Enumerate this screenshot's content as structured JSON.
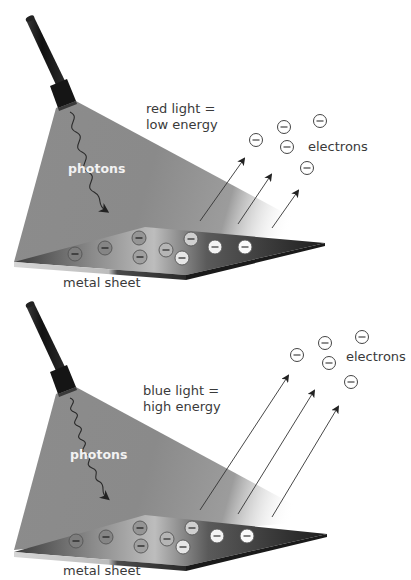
{
  "panels": [
    {
      "id": "red",
      "light_label_line1": "red light =",
      "light_label_line2": "low energy",
      "photons_label": "photons",
      "electrons_label": "electrons",
      "sheet_label": "metal sheet",
      "energy": "low",
      "emitted_electron_count": 6,
      "sheet_electron_count": 9,
      "arrow_count": 3
    },
    {
      "id": "blue",
      "light_label_line1": "blue light =",
      "light_label_line2": "high energy",
      "photons_label": "photons",
      "electrons_label": "electrons",
      "sheet_label": "metal sheet",
      "energy": "high",
      "emitted_electron_count": 6,
      "sheet_electron_count": 9,
      "arrow_count": 3
    }
  ],
  "icons": {
    "electron": "circle-minus-icon",
    "flashlight": "flashlight-icon",
    "photon": "wavy-arrow-icon",
    "trajectory": "arrow-icon"
  },
  "colors": {
    "beam": "#8a8a8a",
    "flashlight": "#1a1a1a",
    "sheet_dark": "#2a2a2a",
    "sheet_edge": "#c8c8c8",
    "text": "#3a3a3a",
    "photon_text": "#f2f2f2"
  }
}
